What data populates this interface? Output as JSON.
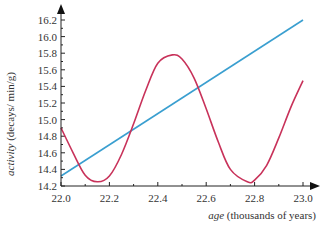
{
  "chart_data": {
    "type": "line",
    "title": "",
    "xlabel": "age (thousands of years)",
    "xlabel_italic": "age",
    "xlabel_rest": " (thousands of years)",
    "ylabel": "activity (decays/ min/g)",
    "ylabel_italic": "activity",
    "ylabel_rest": " (decays/ min/g)",
    "xlim": [
      22.0,
      23.0
    ],
    "ylim": [
      14.2,
      16.2
    ],
    "x_ticks": [
      "22.0",
      "22.2",
      "22.4",
      "22.6",
      "22.8",
      "23.0"
    ],
    "y_ticks": [
      "14.2",
      "14.4",
      "14.6",
      "14.8",
      "15.0",
      "15.2",
      "15.4",
      "15.6",
      "15.8",
      "16.0",
      "16.2"
    ],
    "grid": false,
    "legend": null,
    "series": [
      {
        "name": "calibration line",
        "color": "#3a9fd0",
        "x": [
          22.0,
          23.0
        ],
        "values": [
          14.32,
          16.2
        ]
      },
      {
        "name": "oscillating curve",
        "color": "#c8325a",
        "x": [
          22.0,
          22.05,
          22.1,
          22.15,
          22.2,
          22.25,
          22.3,
          22.35,
          22.4,
          22.46,
          22.5,
          22.55,
          22.6,
          22.65,
          22.7,
          22.77,
          22.8,
          22.85,
          22.9,
          22.95,
          23.0
        ],
        "values": [
          14.9,
          14.6,
          14.33,
          14.25,
          14.32,
          14.58,
          14.95,
          15.35,
          15.68,
          15.78,
          15.73,
          15.5,
          15.13,
          14.73,
          14.4,
          14.25,
          14.27,
          14.45,
          14.78,
          15.15,
          15.47
        ]
      }
    ]
  }
}
